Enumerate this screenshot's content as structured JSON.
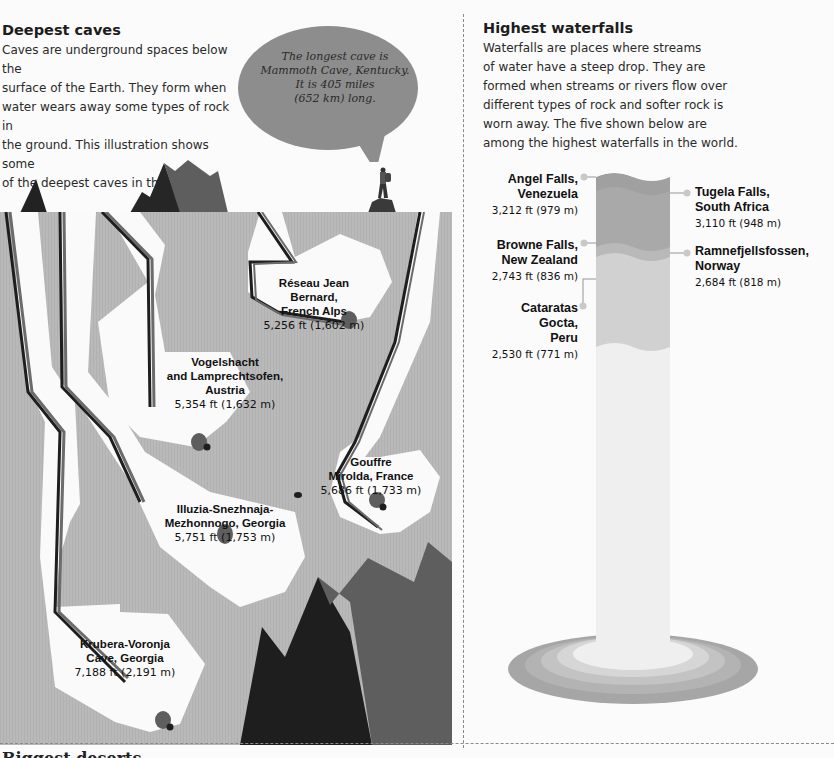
{
  "caves": {
    "title": "Deepest caves",
    "intro": "Caves are underground spaces below the surface of the Earth. They form when water wears away some types of rock in the ground. This illustration shows some of the deepest caves in the world.",
    "intro_lines": [
      "Caves are underground spaces below the",
      "surface of the Earth. They form when",
      "water wears away some types of rock in",
      "the ground. This illustration shows some",
      "of the deepest caves in the world."
    ],
    "speech_bubble": {
      "lines": [
        "The longest cave is",
        "Mammoth Cave, Kentucky.",
        "It is 405 miles",
        "(652 km) long."
      ]
    },
    "items": [
      {
        "name_lines": [
          "Réseau Jean",
          "Bernard,",
          "French Alps"
        ],
        "depth": "5,256 ft (1,602 m)"
      },
      {
        "name_lines": [
          "Vogelshacht",
          "and Lamprechtsofen,",
          "Austria"
        ],
        "depth": "5,354 ft (1,632 m)"
      },
      {
        "name_lines": [
          "Gouffre",
          "Mirolda, France"
        ],
        "depth": "5,686 ft (1,733 m)"
      },
      {
        "name_lines": [
          "Illuzia-Snezhnaja-",
          "Mezhonnogo, Georgia"
        ],
        "depth": "5,751 ft (1,753 m)"
      },
      {
        "name_lines": [
          "Krubera-Voronja",
          "Cave, Georgia"
        ],
        "depth": "7,188 ft (2,191 m)"
      }
    ]
  },
  "waterfalls": {
    "title": "Highest waterfalls",
    "intro_lines": [
      "Waterfalls are places where streams",
      "of water have a steep drop. They are",
      "formed when streams or rivers flow over",
      "different types of rock and softer rock is",
      "worn away. The five shown below are",
      "among the highest waterfalls in the world."
    ],
    "items": [
      {
        "name_lines": [
          "Angel Falls,",
          "Venezuela"
        ],
        "height": "3,212 ft (979 m)"
      },
      {
        "name_lines": [
          "Tugela Falls,",
          "South Africa"
        ],
        "height": "3,110 ft (948 m)"
      },
      {
        "name_lines": [
          "Browne Falls,",
          "New Zealand"
        ],
        "height": "2,743 ft (836 m)"
      },
      {
        "name_lines": [
          "Ramnefjellsfossen,",
          "Norway"
        ],
        "height": "2,684 ft (818 m)"
      },
      {
        "name_lines": [
          "Cataratas",
          "Gocta,",
          "Peru"
        ],
        "height": "2,530 ft (771 m)"
      }
    ]
  },
  "next_section": {
    "title": "Biggest deserts"
  },
  "colors": {
    "rock": "#b9b9b9",
    "cave_white": "#fafafa",
    "dark": "#1e1e1e",
    "mid": "#6b6b6b",
    "bubble": "#8a8a8a",
    "water_1": "#a3a3a3",
    "water_2": "#b3b3b3",
    "water_3": "#cfcfcf",
    "water_4": "#ececec"
  }
}
